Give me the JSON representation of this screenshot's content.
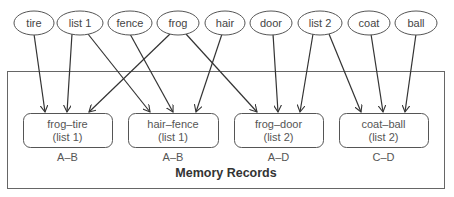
{
  "diagram": {
    "title": "Memory Records",
    "cues": [
      {
        "id": "tire",
        "label": "tire",
        "cx": 34,
        "rx": 20
      },
      {
        "id": "list1",
        "label": "list 1",
        "cx": 80,
        "rx": 23
      },
      {
        "id": "fence",
        "label": "fence",
        "cx": 130,
        "rx": 22
      },
      {
        "id": "frog",
        "label": "frog",
        "cx": 178,
        "rx": 21
      },
      {
        "id": "hair",
        "label": "hair",
        "cx": 225,
        "rx": 20
      },
      {
        "id": "door",
        "label": "door",
        "cx": 271,
        "rx": 21
      },
      {
        "id": "list2",
        "label": "list 2",
        "cx": 320,
        "rx": 22
      },
      {
        "id": "coat",
        "label": "coat",
        "cx": 369,
        "rx": 21
      },
      {
        "id": "ball",
        "label": "ball",
        "cx": 416,
        "rx": 21
      }
    ],
    "records": [
      {
        "id": "frog-tire",
        "line1": "frog–tire",
        "line2": "(list 1)",
        "pair": "A–B",
        "x": 23,
        "w": 89
      },
      {
        "id": "hair-fence",
        "line1": "hair–fence",
        "line2": "(list 1)",
        "pair": "A–B",
        "x": 128,
        "w": 90
      },
      {
        "id": "frog-door",
        "line1": "frog–door",
        "line2": "(list 2)",
        "pair": "A–D",
        "x": 234,
        "w": 89
      },
      {
        "id": "coat-ball",
        "line1": "coat–ball",
        "line2": "(list 2)",
        "pair": "C–D",
        "x": 339,
        "w": 89
      }
    ],
    "links": [
      {
        "from": "tire",
        "to": "frog-tire",
        "x1": 34,
        "x2": 45
      },
      {
        "from": "list1",
        "to": "frog-tire",
        "x1": 72,
        "x2": 67
      },
      {
        "from": "list1",
        "to": "hair-fence",
        "x1": 88,
        "x2": 150
      },
      {
        "from": "fence",
        "to": "hair-fence",
        "x1": 130,
        "x2": 173
      },
      {
        "from": "frog",
        "to": "frog-tire",
        "x1": 170,
        "x2": 89
      },
      {
        "from": "frog",
        "to": "frog-door",
        "x1": 186,
        "x2": 257
      },
      {
        "from": "hair",
        "to": "hair-fence",
        "x1": 222,
        "x2": 196
      },
      {
        "from": "door",
        "to": "frog-door",
        "x1": 273,
        "x2": 278
      },
      {
        "from": "list2",
        "to": "frog-door",
        "x1": 313,
        "x2": 300
      },
      {
        "from": "list2",
        "to": "coat-ball",
        "x1": 329,
        "x2": 361
      },
      {
        "from": "coat",
        "to": "coat-ball",
        "x1": 371,
        "x2": 383
      },
      {
        "from": "ball",
        "to": "coat-ball",
        "x1": 416,
        "x2": 405
      }
    ],
    "colors": {
      "stroke": "#555555",
      "arrow": "#333333",
      "text": "#444444"
    }
  }
}
